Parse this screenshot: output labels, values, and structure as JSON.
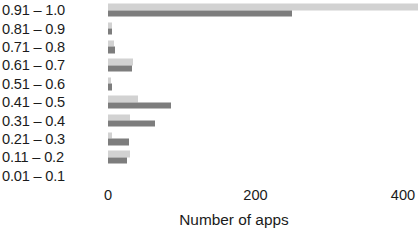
{
  "chart_data": {
    "type": "bar",
    "orientation": "horizontal",
    "title": "",
    "xlabel": "Number of apps",
    "ylabel": "",
    "xlim": [
      0,
      420
    ],
    "x_ticks": [
      0,
      200,
      400
    ],
    "x_tick_labels": [
      "0",
      "200",
      "400"
    ],
    "grid": false,
    "legend": null,
    "categories": [
      "0.91 – 1.0",
      "0.81 – 0.9",
      "0.71 – 0.8",
      "0.61 – 0.7",
      "0.51 – 0.6",
      "0.41 – 0.5",
      "0.31 – 0.4",
      "0.21 – 0.3",
      "0.11 – 0.2",
      "0.01 – 0.1"
    ],
    "series": [
      {
        "name": "series-light",
        "color": "#d2d2d2",
        "values": [
          420,
          5,
          8,
          34,
          4,
          40,
          30,
          6,
          30,
          0
        ]
      },
      {
        "name": "series-dark",
        "color": "#7d7d7d",
        "values": [
          250,
          5,
          10,
          32,
          6,
          85,
          64,
          28,
          26,
          0
        ]
      }
    ]
  },
  "colors": {
    "background": "#ffffff",
    "text": "#1b1b1b",
    "series_light": "#d2d2d2",
    "series_dark": "#7d7d7d"
  }
}
